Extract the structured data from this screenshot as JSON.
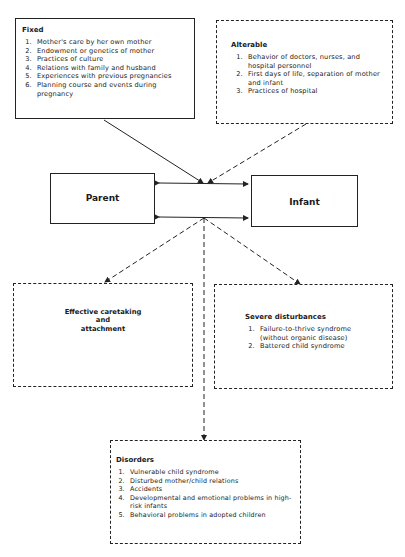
{
  "fixed": {
    "title": "Fixed",
    "items": [
      "Mother's care by her own mother",
      "Endowment or genetics of mother",
      "Practices of culture",
      "Relations with family and husband",
      "Experiences with previous pregnancies",
      "Planning course and events during pregnancy"
    ]
  },
  "alterable": {
    "title": "Alterable",
    "items": [
      "Behavior of doctors, nurses, and hospital personnel",
      "First days of life, separation of mother and infant",
      "Practices of hospital"
    ]
  },
  "parent": {
    "label": "Parent"
  },
  "infant": {
    "label": "Infant"
  },
  "effective": {
    "line1": "Effective caretaking",
    "line2": "and",
    "line3": "attachment"
  },
  "severe": {
    "title": "Severe disturbances",
    "items": [
      "Failure-to-thrive syndrome (without organic disease)",
      "Battered child syndrome"
    ]
  },
  "disorders": {
    "title": "Disorders",
    "items": [
      "Vulnerable child syndrome",
      "Disturbed mother/child relations",
      "Accidents",
      "Developmental and emotional problems in high-risk infants",
      "Behavioral problems in adopted children"
    ]
  }
}
